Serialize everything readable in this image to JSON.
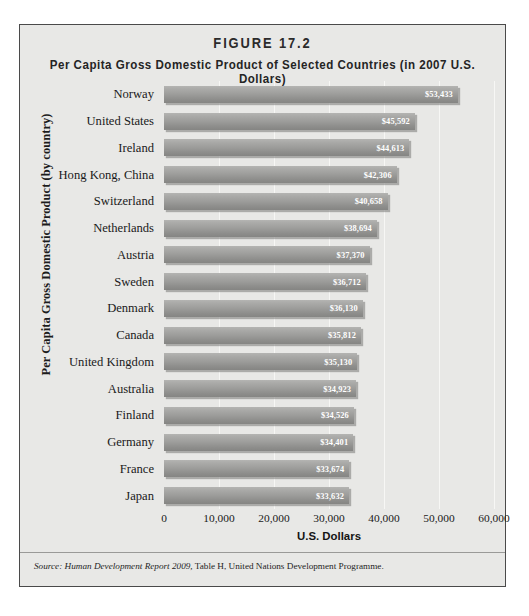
{
  "figure": {
    "number_label": "FIGURE 17.2",
    "subtitle": "Per Capita Gross Domestic Product of Selected Countries (in 2007 U.S. Dollars)",
    "source_prefix": "Source:",
    "source_italic": "Human Development Report 2009,",
    "source_rest": "Table H, United Nations Development Programme."
  },
  "colors": {
    "card_background": "#e8e8e6",
    "card_border": "#4a4a4a",
    "bar_light": "#b4b4b2",
    "bar_dark": "#858583",
    "gridline": "#f7f7f5",
    "value_text": "#ffffff",
    "label_text": "#1a1a1a"
  },
  "chart_data": {
    "type": "bar",
    "orientation": "horizontal",
    "title": "Per Capita Gross Domestic Product of Selected Countries (in 2007 U.S. Dollars)",
    "xlabel": "U.S. Dollars",
    "ylabel": "Per Capita Gross Domestic Product (by country)",
    "xlim": [
      0,
      60000
    ],
    "xticks": [
      0,
      10000,
      20000,
      30000,
      40000,
      50000,
      60000
    ],
    "xtick_labels": [
      "0",
      "10,000",
      "20,000",
      "30,000",
      "40,000",
      "50,000",
      "60,000"
    ],
    "grid": true,
    "grid_axis": "x",
    "legend": false,
    "value_label_format": "$#,###",
    "categories": [
      "Norway",
      "United States",
      "Ireland",
      "Hong Kong, China",
      "Switzerland",
      "Netherlands",
      "Austria",
      "Sweden",
      "Denmark",
      "Canada",
      "United Kingdom",
      "Australia",
      "Finland",
      "Germany",
      "France",
      "Japan"
    ],
    "values": [
      53433,
      45592,
      44613,
      42306,
      40658,
      38694,
      37370,
      36712,
      36130,
      35812,
      35130,
      34923,
      34526,
      34401,
      33674,
      33632
    ],
    "value_labels": [
      "$53,433",
      "$45,592",
      "$44,613",
      "$42,306",
      "$40,658",
      "$38,694",
      "$37,370",
      "$36,712",
      "$36,130",
      "$35,812",
      "$35,130",
      "$34,923",
      "$34,526",
      "$34,401",
      "$33,674",
      "$33,632"
    ]
  }
}
